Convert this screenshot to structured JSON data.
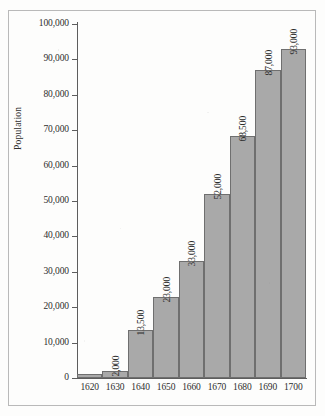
{
  "figure": {
    "frame_color": "#b9b9b9",
    "background_color": "#fdfdfc"
  },
  "chart_data": {
    "type": "bar",
    "title": "",
    "subtitle": "",
    "xlabel": "",
    "ylabel": "Population",
    "categories": [
      "1620",
      "1630",
      "1640",
      "1650",
      "1660",
      "1670",
      "1680",
      "1690",
      "1700"
    ],
    "values": [
      1000,
      2000,
      13500,
      23000,
      33000,
      52000,
      68500,
      87000,
      93000
    ],
    "value_labels": [
      "",
      "2,000",
      "13,500",
      "23,000",
      "33,000",
      "52,000",
      "68,500",
      "87,000",
      "93,000"
    ],
    "ylim": [
      0,
      100000
    ],
    "ytick_values": [
      0,
      10000,
      20000,
      30000,
      40000,
      50000,
      60000,
      70000,
      80000,
      90000,
      100000
    ],
    "ytick_labels": [
      "0",
      "10,000",
      "20,000",
      "30,000",
      "40,000",
      "50,000",
      "60,000",
      "70,000",
      "80,000",
      "90,000",
      "100,000"
    ],
    "grid": false,
    "legend": false,
    "legend_position": "none",
    "bar_fill_color": "#a9a9a9",
    "bar_edge_color": "#6f6f6f",
    "bar_gap": 0,
    "value_label_rotation": 90,
    "axis_color": "#5d5d5d"
  }
}
